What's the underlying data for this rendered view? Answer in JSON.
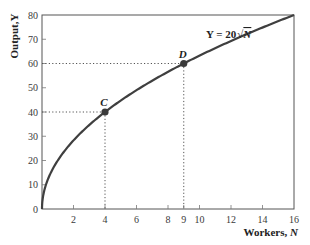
{
  "chart_data": {
    "type": "line",
    "title": "",
    "xlabel": "Workers, N",
    "ylabel": "Output, Y",
    "xlim": [
      0,
      16
    ],
    "ylim": [
      0,
      80
    ],
    "x_ticks": [
      2,
      4,
      6,
      8,
      9,
      10,
      12,
      14,
      16
    ],
    "y_ticks": [
      0,
      10,
      20,
      30,
      40,
      50,
      60,
      70,
      80
    ],
    "grid": false,
    "legend": null,
    "series": [
      {
        "name": "Y = 20√N",
        "function": "Y = 20*sqrt(N)",
        "x": [
          0,
          1,
          2,
          3,
          4,
          5,
          6,
          7,
          8,
          9,
          10,
          11,
          12,
          13,
          14,
          15,
          16
        ],
        "values": [
          0,
          20,
          28.28,
          34.64,
          40,
          44.72,
          48.99,
          52.92,
          56.57,
          60,
          63.25,
          66.33,
          69.28,
          72.11,
          74.83,
          77.46,
          80
        ]
      }
    ],
    "annotations": [
      {
        "label": "C",
        "x": 4,
        "y": 40,
        "dotted_guides": true
      },
      {
        "label": "D",
        "x": 9,
        "y": 60,
        "dotted_guides": true
      },
      {
        "label": "Y = 20√N",
        "type": "equation",
        "position": "near curve, upper right"
      }
    ]
  },
  "labels": {
    "xlabel_main": "Workers, ",
    "xlabel_var": "N",
    "ylabel": "Output,Y",
    "equation_prefix": "Y = 20",
    "equation_var": "N",
    "point_c": "C",
    "point_d": "D"
  }
}
